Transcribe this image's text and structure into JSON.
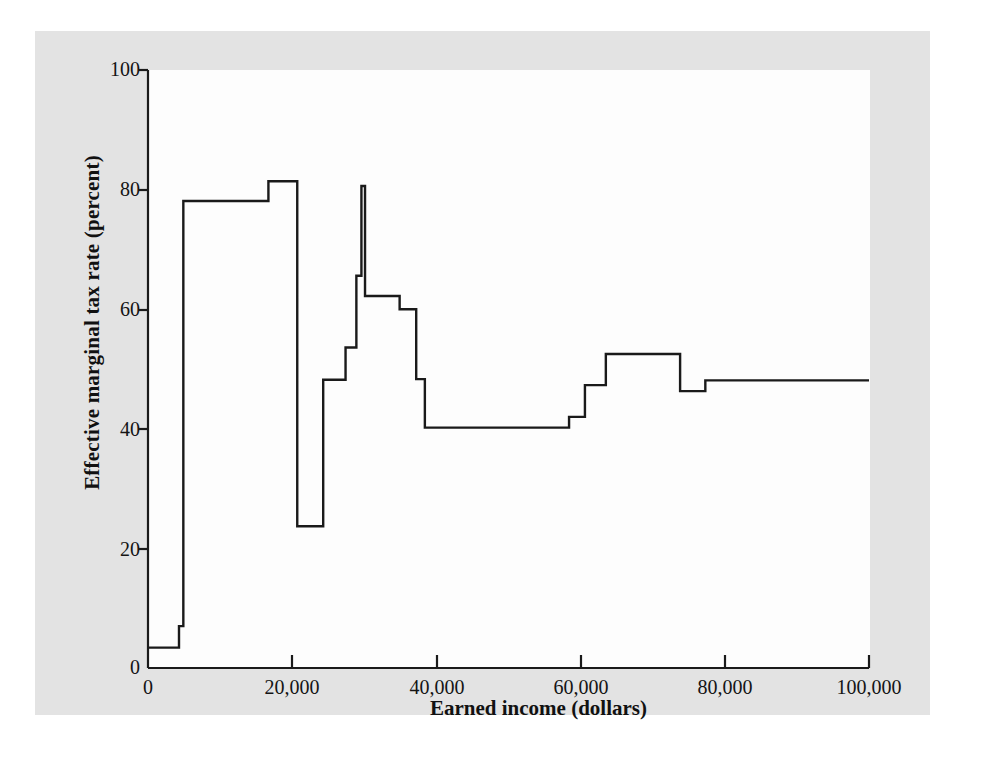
{
  "figure": {
    "background_color": "#ffffff",
    "panel_color": "#e3e3e3",
    "plot_color": "#fdfdfd",
    "line_color": "#1a1a1a"
  },
  "chart_data": {
    "type": "line",
    "title": "",
    "subtitle": "",
    "xlabel": "Earned income (dollars)",
    "ylabel": "Effective marginal tax rate (percent)",
    "xlim": [
      0,
      100000
    ],
    "ylim": [
      0,
      100
    ],
    "xticks": [
      0,
      20000,
      40000,
      60000,
      80000,
      100000
    ],
    "xticklabels": [
      "0",
      "20,000",
      "40,000",
      "60,000",
      "80,000",
      "100,000"
    ],
    "yticks": [
      0,
      20,
      40,
      60,
      80,
      100
    ],
    "yticklabels": [
      "0",
      "20",
      "40",
      "60",
      "80",
      "100"
    ],
    "grid": false,
    "legend": null,
    "legend_position": "none",
    "drawstyle": "steps-post",
    "series": [
      {
        "name": "Effective marginal tax rate",
        "color": "#1a1a1a",
        "x": [
          0,
          2600,
          4300,
          4900,
          13800,
          16700,
          19000,
          20700,
          24300,
          25800,
          27400,
          28900,
          29600,
          30100,
          34900,
          35800,
          37200,
          38400,
          39000,
          56700,
          58400,
          60600,
          63500,
          66200,
          73800,
          74800,
          77300,
          78300,
          100000
        ],
        "y": [
          3.4,
          3.4,
          7.0,
          78.1,
          78.1,
          81.4,
          81.4,
          23.7,
          23.7,
          48.2,
          48.2,
          53.6,
          65.6,
          65.6,
          80.6,
          62.2,
          62.2,
          60.0,
          60.0,
          48.3,
          40.2,
          40.2,
          42.0,
          47.3,
          47.3,
          52.5,
          52.5,
          46.3,
          48.1
        ],
        "steps": [
          {
            "x_start": 0,
            "x_end": 4300,
            "rate": 3.4
          },
          {
            "x_start": 4300,
            "x_end": 4900,
            "rate": 7.0
          },
          {
            "x_start": 4900,
            "x_end": 16700,
            "rate": 78.1
          },
          {
            "x_start": 16700,
            "x_end": 20700,
            "rate": 81.4
          },
          {
            "x_start": 20700,
            "x_end": 24300,
            "rate": 23.7
          },
          {
            "x_start": 24300,
            "x_end": 27400,
            "rate": 48.2
          },
          {
            "x_start": 27400,
            "x_end": 28900,
            "rate": 53.6
          },
          {
            "x_start": 28900,
            "x_end": 29600,
            "rate": 65.6
          },
          {
            "x_start": 29600,
            "x_end": 30100,
            "rate": 80.6
          },
          {
            "x_start": 30100,
            "x_end": 34900,
            "rate": 62.2
          },
          {
            "x_start": 34900,
            "x_end": 37200,
            "rate": 60.0
          },
          {
            "x_start": 37200,
            "x_end": 38400,
            "rate": 48.3
          },
          {
            "x_start": 38400,
            "x_end": 58400,
            "rate": 40.2
          },
          {
            "x_start": 58400,
            "x_end": 60600,
            "rate": 42.0
          },
          {
            "x_start": 60600,
            "x_end": 63500,
            "rate": 47.3
          },
          {
            "x_start": 63500,
            "x_end": 73800,
            "rate": 52.5
          },
          {
            "x_start": 73800,
            "x_end": 77300,
            "rate": 46.3
          },
          {
            "x_start": 77300,
            "x_end": 100000,
            "rate": 48.1
          }
        ]
      }
    ],
    "annotations": []
  }
}
